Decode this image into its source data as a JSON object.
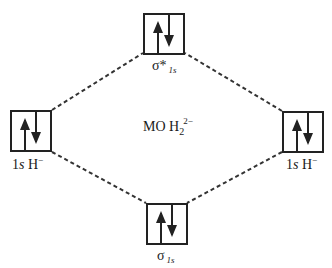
{
  "diagram": {
    "center_label": {
      "prefix": "MO H",
      "subscript": "2",
      "superscript": "2−"
    },
    "orbitals": [
      {
        "id": "sigma-star-1s",
        "label_main": "σ*",
        "label_sub": "1s",
        "electrons": [
          "up",
          "down"
        ]
      },
      {
        "id": "left-1s-H",
        "label_main": "1",
        "label_italic": "s",
        "label_rest": " H",
        "label_sup": "−",
        "electrons": [
          "up",
          "down"
        ]
      },
      {
        "id": "right-1s-H",
        "label_main": "1",
        "label_italic": "s",
        "label_rest": " H",
        "label_sup": "−",
        "electrons": [
          "up",
          "down"
        ]
      },
      {
        "id": "sigma-1s",
        "label_main": "σ",
        "label_sub": "1s",
        "electrons": [
          "up",
          "down"
        ]
      }
    ],
    "connectors": [
      {
        "from": "left-1s-H",
        "to": "sigma-star-1s",
        "style": "dashed"
      },
      {
        "from": "right-1s-H",
        "to": "sigma-star-1s",
        "style": "dashed"
      },
      {
        "from": "left-1s-H",
        "to": "sigma-1s",
        "style": "dashed"
      },
      {
        "from": "right-1s-H",
        "to": "sigma-1s",
        "style": "dashed"
      }
    ]
  }
}
